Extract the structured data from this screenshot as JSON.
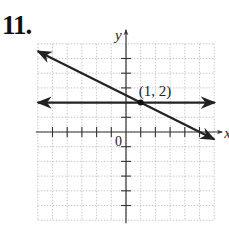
{
  "problem_number": "11.",
  "chart_data": {
    "type": "line",
    "title": "",
    "xlabel": "x",
    "ylabel": "y",
    "origin_label": "0",
    "xlim": [
      -6,
      6
    ],
    "ylim": [
      -6,
      6
    ],
    "grid": true,
    "series": [
      {
        "name": "horizontal line",
        "equation": "y = 2",
        "x": [
          -6,
          6
        ],
        "y": [
          2,
          2
        ]
      },
      {
        "name": "slanted line",
        "equation": "y = -x/2 + 5/2",
        "x": [
          -6,
          6
        ],
        "y": [
          5.5,
          -0.5
        ]
      }
    ],
    "points": [
      {
        "x": 1,
        "y": 2,
        "label": "(1, 2)"
      }
    ],
    "annotations": [
      "(1, 2)"
    ]
  }
}
